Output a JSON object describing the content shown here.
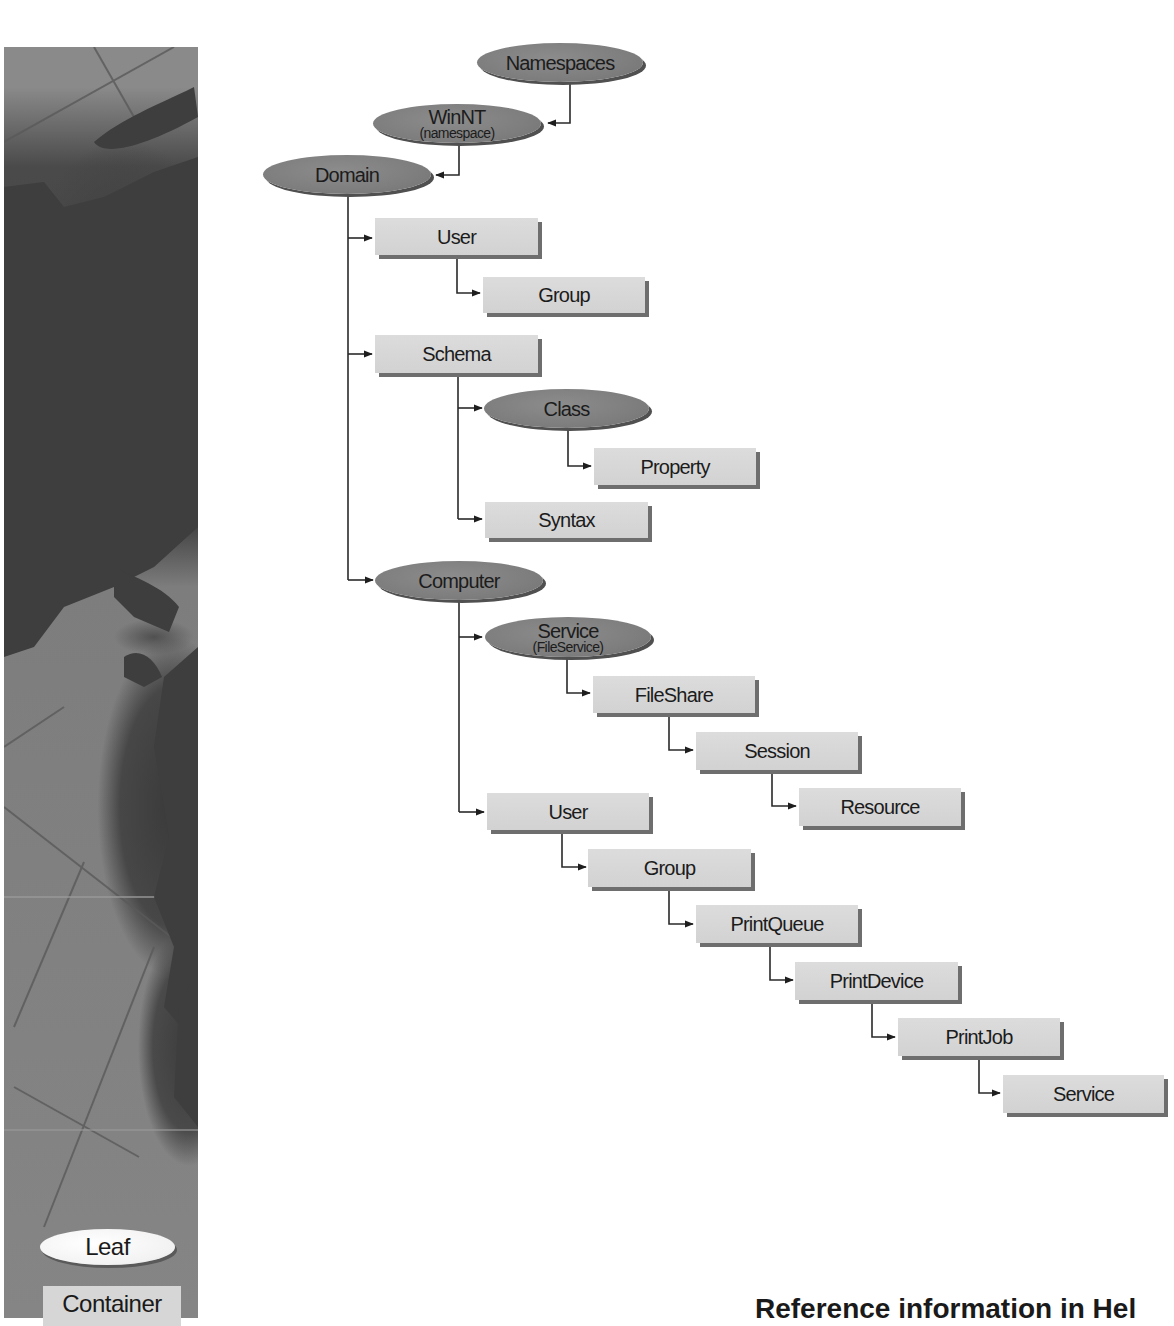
{
  "legend": {
    "leaf_label": "Leaf",
    "container_label": "Container"
  },
  "footer": {
    "heading": "Reference information in Hel"
  },
  "tree": {
    "namespaces": {
      "label": "Namespaces",
      "shape": "ellipse"
    },
    "winnt": {
      "label": "WinNT",
      "sublabel": "(namespace)",
      "shape": "ellipse"
    },
    "domain": {
      "label": "Domain",
      "shape": "ellipse"
    },
    "domain_user": {
      "label": "User",
      "shape": "rect"
    },
    "domain_user_group": {
      "label": "Group",
      "shape": "rect"
    },
    "schema": {
      "label": "Schema",
      "shape": "rect"
    },
    "class": {
      "label": "Class",
      "shape": "ellipse"
    },
    "property": {
      "label": "Property",
      "shape": "rect"
    },
    "syntax": {
      "label": "Syntax",
      "shape": "rect"
    },
    "computer": {
      "label": "Computer",
      "shape": "ellipse"
    },
    "service_fileservice": {
      "label": "Service",
      "sublabel": "(FileService)",
      "shape": "ellipse"
    },
    "fileshare": {
      "label": "FileShare",
      "shape": "rect"
    },
    "session": {
      "label": "Session",
      "shape": "rect"
    },
    "resource": {
      "label": "Resource",
      "shape": "rect"
    },
    "computer_user": {
      "label": "User",
      "shape": "rect"
    },
    "computer_group": {
      "label": "Group",
      "shape": "rect"
    },
    "printqueue": {
      "label": "PrintQueue",
      "shape": "rect"
    },
    "printdevice": {
      "label": "PrintDevice",
      "shape": "rect"
    },
    "printjob": {
      "label": "PrintJob",
      "shape": "rect"
    },
    "service": {
      "label": "Service",
      "shape": "rect"
    }
  },
  "edges": [
    [
      "namespaces",
      "winnt"
    ],
    [
      "winnt",
      "domain"
    ],
    [
      "domain",
      "domain_user"
    ],
    [
      "domain_user",
      "domain_user_group"
    ],
    [
      "domain",
      "schema"
    ],
    [
      "schema",
      "class"
    ],
    [
      "class",
      "property"
    ],
    [
      "schema",
      "syntax"
    ],
    [
      "domain",
      "computer"
    ],
    [
      "computer",
      "service_fileservice"
    ],
    [
      "service_fileservice",
      "fileshare"
    ],
    [
      "fileshare",
      "session"
    ],
    [
      "session",
      "resource"
    ],
    [
      "computer",
      "computer_user"
    ],
    [
      "computer_user",
      "computer_group"
    ],
    [
      "computer_group",
      "printqueue"
    ],
    [
      "printqueue",
      "printdevice"
    ],
    [
      "printdevice",
      "printjob"
    ],
    [
      "printjob",
      "service"
    ]
  ],
  "colors": {
    "ellipse_fill": "#7e7e7e",
    "rect_fill": "#d6d6d6",
    "shadow": "#6e6e6e",
    "line": "#2a2a2a"
  }
}
